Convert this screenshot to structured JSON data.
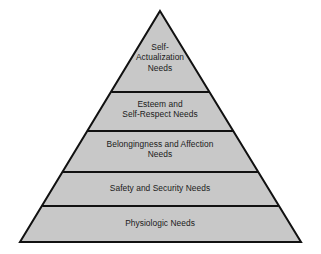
{
  "figure": {
    "name": "maslow-hierarchy-of-needs-pyramid",
    "type": "pyramid-diagram",
    "background_color": "#ffffff",
    "fill_color": "#c8c8c8",
    "stroke_color": "#111111",
    "text_color": "#1a1a1a"
  },
  "pyramid": {
    "apex": {
      "x": 160,
      "y": 11
    },
    "base_left": {
      "x": 20,
      "y": 242
    },
    "base_right": {
      "x": 301,
      "y": 242
    },
    "divider_y": [
      92,
      131,
      172,
      206
    ],
    "tiers": [
      {
        "index": 0,
        "level": 5,
        "label": "Self-\nActualization\nNeeds",
        "lines": [
          "Self-",
          "Actualization",
          "Needs"
        ]
      },
      {
        "index": 1,
        "level": 4,
        "label": "Esteem and\nSelf-Respect Needs",
        "lines": [
          "Esteem and",
          "Self-Respect Needs"
        ]
      },
      {
        "index": 2,
        "level": 3,
        "label": "Belongingness and Affection\nNeeds",
        "lines": [
          "Belongingness and Affection",
          "Needs"
        ]
      },
      {
        "index": 3,
        "level": 2,
        "label": "Safety and Security Needs",
        "lines": [
          "Safety and Security Needs"
        ]
      },
      {
        "index": 4,
        "level": 1,
        "label": "Physiologic Needs",
        "lines": [
          "Physiologic Needs"
        ]
      }
    ]
  }
}
